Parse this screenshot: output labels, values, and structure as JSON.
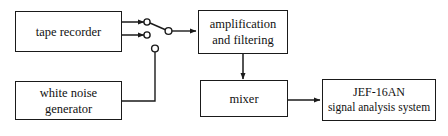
{
  "diagram": {
    "background_color": "#ffffff",
    "stroke_color": "#1a1a1a",
    "nodes": [
      {
        "id": "tape-recorder",
        "lines": [
          "tape recorder"
        ],
        "line1": "tape recorder"
      },
      {
        "id": "white-noise-generator",
        "lines": [
          "white noise",
          "generator"
        ],
        "line1": "white noise",
        "line2": "generator"
      },
      {
        "id": "amplification-and-filtering",
        "lines": [
          "amplification",
          "and filtering"
        ],
        "line1": "amplification",
        "line2": "and filtering"
      },
      {
        "id": "mixer",
        "lines": [
          "mixer"
        ],
        "line1": "mixer"
      },
      {
        "id": "signal-analysis-system",
        "lines": [
          "JEF-16AN",
          "signal analysis system"
        ],
        "line1": "JEF-16AN",
        "line2": "signal analysis system"
      }
    ],
    "connectors": [
      {
        "id": "tape-recorder-upper-output",
        "from": "tape-recorder",
        "to": "switch-contact-upper",
        "arrow": true
      },
      {
        "id": "tape-recorder-lower-output",
        "from": "tape-recorder",
        "to": "switch-contact-lower",
        "arrow": true
      },
      {
        "id": "switch-blade",
        "from": "switch-contact-upper",
        "to": "switch-pivot",
        "arrow": false
      },
      {
        "id": "switch-pivot-to-amplification",
        "from": "switch-pivot",
        "to": "amplification-and-filtering",
        "arrow": true
      },
      {
        "id": "white-noise-to-switch-contact",
        "from": "white-noise-generator",
        "to": "switch-contact-noise",
        "arrow": false
      },
      {
        "id": "amplification-to-mixer",
        "from": "amplification-and-filtering",
        "to": "mixer",
        "arrow": true
      },
      {
        "id": "mixer-to-analysis",
        "from": "mixer",
        "to": "signal-analysis-system",
        "arrow": true
      }
    ],
    "switch_terminals": [
      {
        "id": "switch-contact-upper",
        "cx": 147,
        "cy": 22
      },
      {
        "id": "switch-contact-lower",
        "cx": 147,
        "cy": 35
      },
      {
        "id": "switch-pivot",
        "cx": 168,
        "cy": 31
      },
      {
        "id": "switch-contact-noise",
        "cx": 155,
        "cy": 48
      }
    ]
  }
}
